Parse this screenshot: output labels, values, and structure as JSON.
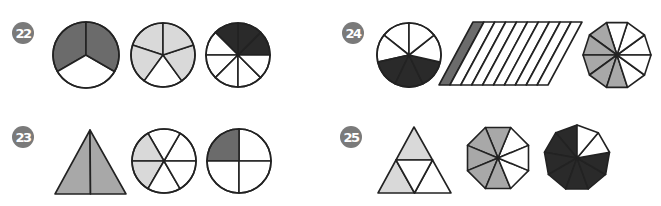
{
  "colors": {
    "dark_gray": "#6b6b6b",
    "light_gray": "#d9d9d9",
    "medium_gray": "#a8a8a8",
    "black": "#2a2a2a",
    "white": "#ffffff",
    "stroke": "#222222",
    "badge": "#7a7a7a"
  },
  "problems": [
    {
      "number": "22",
      "badge": {
        "x": 12,
        "y": 22
      },
      "figures": [
        {
          "type": "circle",
          "cx": 86,
          "cy": 55,
          "r": 33,
          "parts": 3,
          "start_deg": 90,
          "shaded": [
            0,
            2
          ],
          "fill": "dark_gray"
        },
        {
          "type": "circle",
          "cx": 163,
          "cy": 55,
          "r": 32,
          "parts": 5,
          "start_deg": 90,
          "shaded": [
            0,
            1,
            2,
            3
          ],
          "shaded_note": "4 of 5 light",
          "fill": "light_gray",
          "shaded_indices": [
            0,
            1,
            3,
            4
          ]
        },
        {
          "type": "circle",
          "cx": 238,
          "cy": 55,
          "r": 32,
          "parts": 8,
          "start_deg": 0,
          "shaded_indices": [
            0,
            1,
            2
          ],
          "fill": "black"
        }
      ]
    },
    {
      "number": "23",
      "badge": {
        "x": 12,
        "y": 126
      },
      "figures": [
        {
          "type": "triangle_halves",
          "apex": [
            90,
            130
          ],
          "left": [
            55,
            194
          ],
          "right": [
            126,
            194
          ],
          "fill": "medium_gray"
        },
        {
          "type": "circle",
          "cx": 164,
          "cy": 161,
          "r": 32,
          "parts": 6,
          "start_deg": 0,
          "shaded_indices": [
            2,
            3
          ],
          "fill": "light_gray"
        },
        {
          "type": "circle",
          "cx": 239,
          "cy": 161,
          "r": 32,
          "parts": 4,
          "start_deg": 0,
          "shaded_indices": [
            1
          ],
          "fill": "dark_gray"
        }
      ]
    },
    {
      "number": "24",
      "badge": {
        "x": 342,
        "y": 22
      },
      "figures": [
        {
          "type": "circle",
          "cx": 409,
          "cy": 55,
          "r": 32,
          "parts": 7,
          "start_deg": 90,
          "shaded_indices": [
            2,
            3,
            4
          ],
          "fill": "black"
        },
        {
          "type": "parallelogram",
          "top_left": [
            473,
            22
          ],
          "top_right": [
            582,
            22
          ],
          "bottom_left": [
            439,
            85
          ],
          "bottom_right": [
            548,
            85
          ],
          "parts": 10,
          "shaded_indices": [
            0
          ],
          "fill": "dark_gray"
        },
        {
          "type": "polygon",
          "cx": 617,
          "cy": 55,
          "r": 34,
          "sides": 10,
          "rotation_deg": 0,
          "shaded_indices": [
            3,
            4,
            5,
            6,
            7
          ],
          "fill": "medium_gray"
        }
      ]
    },
    {
      "number": "25",
      "badge": {
        "x": 340,
        "y": 126
      },
      "figures": [
        {
          "type": "triangle_quarters",
          "apex": [
            414,
            127
          ],
          "left": [
            378,
            193
          ],
          "right": [
            451,
            193
          ],
          "shaded": [
            "top",
            "bottom_left"
          ],
          "fill": "light_gray"
        },
        {
          "type": "polygon",
          "cx": 498,
          "cy": 158,
          "r": 33,
          "sides": 8,
          "rotation_deg": 22.5,
          "shaded_indices": [
            1,
            2,
            3,
            4,
            5
          ],
          "fill": "medium_gray"
        },
        {
          "type": "polygon",
          "cx": 577,
          "cy": 158,
          "r": 33,
          "sides": 9,
          "rotation_deg": 90,
          "shaded_indices": [
            0,
            1,
            2,
            3,
            4,
            5,
            6
          ],
          "fill": "black",
          "white_note": "2 of 9 white at top-right"
        }
      ]
    }
  ]
}
